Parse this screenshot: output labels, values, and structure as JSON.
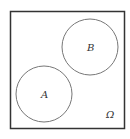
{
  "diagram": {
    "type": "venn",
    "universe": {
      "label": "Ω",
      "x": 10,
      "y": 11,
      "width": 114,
      "height": 117
    },
    "sets": [
      {
        "label": "A",
        "cx": 44,
        "cy": 94,
        "r": 28
      },
      {
        "label": "B",
        "cx": 90,
        "cy": 47,
        "r": 28
      }
    ],
    "relationship": "disjoint",
    "colors": {
      "stroke_universe": "#333333",
      "stroke_circle": "#777777",
      "text": "#333333"
    }
  }
}
